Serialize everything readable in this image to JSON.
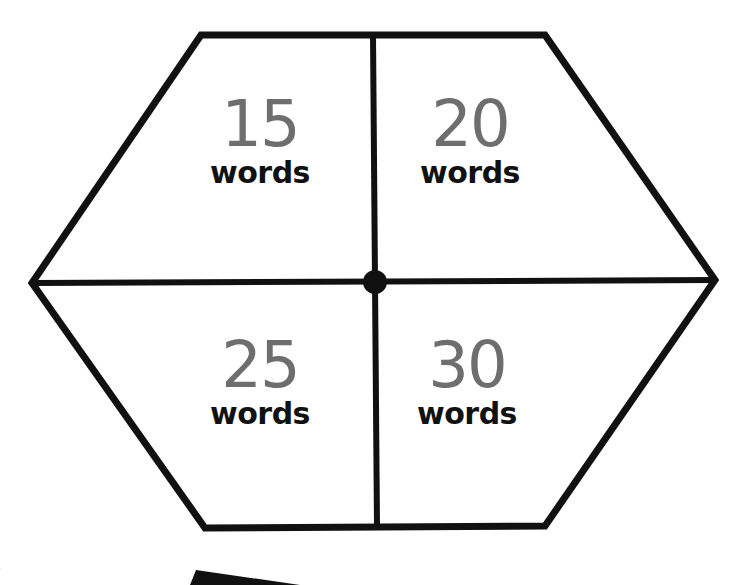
{
  "board": {
    "shape": "hexagon",
    "stroke_color": "#111111",
    "number_color": "#6e6e6e",
    "sections": [
      {
        "position": "top-left",
        "number": "15",
        "label": "words"
      },
      {
        "position": "top-right",
        "number": "20",
        "label": "words"
      },
      {
        "position": "bottom-left",
        "number": "25",
        "label": "words"
      },
      {
        "position": "bottom-right",
        "number": "30",
        "label": "words"
      }
    ]
  },
  "margin_text": "Sen"
}
